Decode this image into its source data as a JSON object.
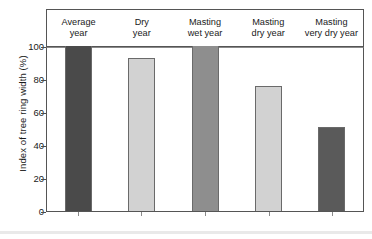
{
  "chart_data": {
    "type": "bar",
    "title": "",
    "subtitle": "",
    "xlabel": "",
    "ylabel": "Index of tree ring width (%)",
    "categories": [
      "Average year",
      "Dry year",
      "Masting wet year",
      "Masting dry year",
      "Masting very dry year"
    ],
    "category_lines": [
      [
        "Average",
        "year"
      ],
      [
        "Dry",
        "year"
      ],
      [
        "Masting",
        "wet year"
      ],
      [
        "Masting",
        "dry year"
      ],
      [
        "Masting",
        "very dry year"
      ]
    ],
    "values": [
      100,
      93,
      100,
      76,
      51
    ],
    "bar_colors": [
      "#4a4a4a",
      "#d2d2d2",
      "#8e8e8e",
      "#d2d2d2",
      "#5a5a5a"
    ],
    "ylim": [
      0,
      100
    ],
    "ytick_labels": [
      "0",
      "20",
      "40",
      "60",
      "80",
      "100"
    ],
    "ytick_values": [
      0,
      20,
      40,
      60,
      80,
      100
    ],
    "grid": false,
    "legend": "none"
  },
  "axis": {
    "y_title": "Index of tree ring width (%)"
  }
}
